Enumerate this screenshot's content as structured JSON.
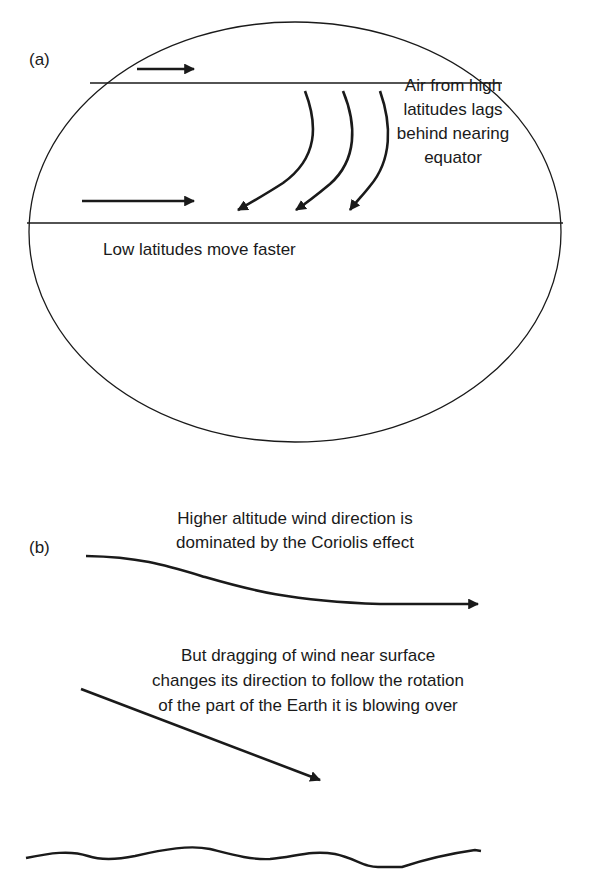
{
  "panel_a": {
    "label": "(a)",
    "annotation_right": "Air from high latitudes lags behind nearing equator",
    "annotation_low": "Low latitudes move faster",
    "elements": {
      "globe": "circle",
      "latitude_lines": 2,
      "eastward_arrows": 2,
      "deflected_curved_arrows": 3
    }
  },
  "panel_b": {
    "label": "(b)",
    "annotation_upper": "Higher altitude wind direction is dominated by the Coriolis effect",
    "annotation_lower": "But dragging of wind near surface changes its direction to follow the rotation of the part of the Earth it is blowing over",
    "elements": {
      "upper_wind_arrow": "curved",
      "surface_wind_arrow": "straight-diagonal",
      "ground_surface": "wavy-line"
    }
  },
  "colors": {
    "ink": "#1a1a1a",
    "background": "#ffffff"
  }
}
